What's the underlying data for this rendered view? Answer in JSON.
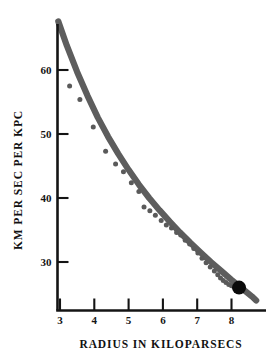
{
  "chart_data": {
    "type": "line",
    "title": "",
    "xlabel": "RADIUS IN KILOPARSECS",
    "ylabel": "KM PER SEC PER KPC",
    "xlim": [
      2.72,
      8.85
    ],
    "ylim": [
      20.5,
      68.5
    ],
    "grid": false,
    "legend": null,
    "xticks": [
      3,
      4,
      5,
      6,
      7,
      8
    ],
    "xtick_labels": [
      "3",
      "4",
      "5",
      "6",
      "7",
      "8"
    ],
    "yticks": [
      30,
      40,
      50,
      60
    ],
    "ytick_labels": [
      "30",
      "40",
      "50",
      "60"
    ],
    "series": [
      {
        "name": "fitted rotation curve",
        "type": "line",
        "color": "#5d5d5d",
        "x": [
          2.95,
          3.2,
          3.5,
          3.8,
          4.1,
          4.4,
          4.7,
          5.0,
          5.3,
          5.6,
          5.9,
          6.2,
          6.5,
          6.8,
          7.1,
          7.4,
          7.7,
          8.0,
          8.3,
          8.6,
          8.72
        ],
        "y": [
          67.6,
          63.8,
          59.7,
          56.0,
          52.6,
          49.6,
          46.9,
          44.4,
          42.1,
          40.0,
          38.1,
          36.3,
          34.6,
          33.0,
          31.5,
          30.0,
          28.6,
          27.2,
          25.9,
          24.6,
          24.0
        ]
      },
      {
        "name": "observed points",
        "type": "scatter",
        "color": "#5a5a5a",
        "x": [
          3.28,
          3.58,
          3.97,
          4.33,
          4.62,
          4.85,
          5.08,
          5.3,
          5.45,
          5.62,
          5.78,
          5.95,
          6.1,
          6.25,
          6.4,
          6.52,
          6.65,
          6.78,
          6.9,
          7.02,
          7.14,
          7.26,
          7.38,
          7.5,
          7.6,
          7.68,
          7.76,
          7.84,
          7.92,
          8.0,
          8.08
        ],
        "y": [
          57.5,
          55.4,
          51.1,
          47.3,
          45.3,
          44.1,
          42.4,
          41.0,
          38.6,
          38.0,
          37.3,
          36.5,
          35.8,
          35.3,
          34.6,
          34.2,
          33.4,
          32.8,
          32.1,
          31.4,
          30.6,
          29.9,
          29.2,
          28.6,
          28.0,
          27.5,
          27.1,
          26.8,
          26.5,
          26.3,
          26.1
        ]
      },
      {
        "name": "sun marker",
        "type": "scatter",
        "color": "#0a0a0a",
        "x": [
          8.22
        ],
        "y": [
          26.0
        ]
      }
    ]
  },
  "axes": {
    "x_title": "RADIUS IN KILOPARSECS",
    "y_title": "KM PER SEC PER KPC"
  }
}
